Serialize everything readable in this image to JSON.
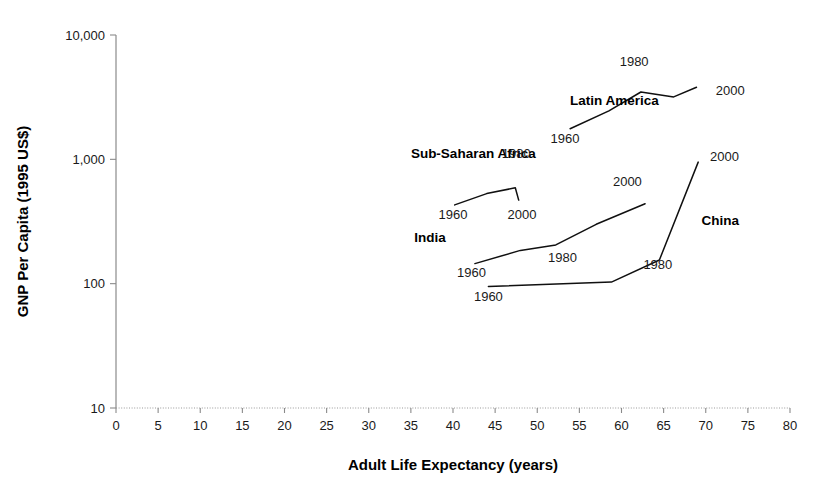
{
  "chart_data": {
    "type": "line",
    "title": "",
    "xlabel": "Adult Life Expectancy (years)",
    "ylabel": "GNP Per Capita (1995 US$)",
    "xlim": [
      0,
      80
    ],
    "ylim": [
      10,
      10000
    ],
    "yscale": "log",
    "grid": false,
    "legend": "inline-labels",
    "xticks": [
      "0",
      "5",
      "10",
      "15",
      "20",
      "25",
      "30",
      "35",
      "40",
      "45",
      "50",
      "55",
      "60",
      "65",
      "70",
      "75",
      "80"
    ],
    "xtick_values": [
      0,
      5,
      10,
      15,
      20,
      25,
      30,
      35,
      40,
      45,
      50,
      55,
      60,
      65,
      70,
      75,
      80
    ],
    "yticks": [
      "10",
      "100",
      "1,000",
      "10,000"
    ],
    "ytick_values": [
      10,
      100,
      1000,
      10000
    ],
    "series": [
      {
        "name": "Latin America",
        "label_x": 53.9,
        "label_y": 2750,
        "points": [
          {
            "year": "1960",
            "x": 53.9,
            "y": 1760
          },
          {
            "x": 58.5,
            "y": 2450
          },
          {
            "year": "1980",
            "x": 62.3,
            "y": 3480
          },
          {
            "x": 66.2,
            "y": 3180
          },
          {
            "year": "2000",
            "x": 68.9,
            "y": 3800
          }
        ],
        "year_labels": [
          {
            "text": "1960",
            "x": 53.3,
            "y": 1360,
            "anchor": "middle"
          },
          {
            "text": "1980",
            "x": 61.5,
            "y": 5600,
            "anchor": "middle"
          },
          {
            "text": "2000",
            "x": 71.2,
            "y": 3320,
            "anchor": "start"
          }
        ]
      },
      {
        "name": "Sub-Saharan Africa",
        "label_x": 35.0,
        "label_y": 1020,
        "points": [
          {
            "year": "1960",
            "x": 40.2,
            "y": 430
          },
          {
            "x": 44.0,
            "y": 530
          },
          {
            "year": "1980",
            "x": 47.4,
            "y": 590
          },
          {
            "year": "2000",
            "x": 47.8,
            "y": 470
          }
        ],
        "year_labels": [
          {
            "text": "1960",
            "x": 40.0,
            "y": 330,
            "anchor": "middle"
          },
          {
            "text": "1980",
            "x": 47.5,
            "y": 1020,
            "anchor": "middle"
          },
          {
            "text": "2000",
            "x": 48.2,
            "y": 330,
            "anchor": "middle"
          }
        ]
      },
      {
        "name": "India",
        "label_x": 35.4,
        "label_y": 218,
        "points": [
          {
            "year": "1960",
            "x": 42.6,
            "y": 145
          },
          {
            "x": 48.0,
            "y": 185
          },
          {
            "year": "1980",
            "x": 52.2,
            "y": 205
          },
          {
            "x": 57.0,
            "y": 300
          },
          {
            "year": "2000",
            "x": 62.8,
            "y": 440
          }
        ],
        "year_labels": [
          {
            "text": "1960",
            "x": 42.2,
            "y": 113,
            "anchor": "middle"
          },
          {
            "text": "1980",
            "x": 53.0,
            "y": 148,
            "anchor": "middle"
          },
          {
            "text": "2000",
            "x": 60.7,
            "y": 610,
            "anchor": "middle"
          }
        ]
      },
      {
        "name": "China",
        "label_x": 69.5,
        "label_y": 297,
        "points": [
          {
            "year": "1960",
            "x": 44.2,
            "y": 95
          },
          {
            "year": "1980",
            "x": 58.8,
            "y": 103
          },
          {
            "x": 64.5,
            "y": 155
          },
          {
            "year": "2000",
            "x": 69.1,
            "y": 950
          }
        ],
        "year_labels": [
          {
            "text": "1960",
            "x": 44.2,
            "y": 72,
            "anchor": "middle"
          },
          {
            "text": "1980",
            "x": 62.6,
            "y": 131,
            "anchor": "start"
          },
          {
            "text": "2000",
            "x": 70.5,
            "y": 970,
            "anchor": "start"
          }
        ]
      }
    ]
  }
}
